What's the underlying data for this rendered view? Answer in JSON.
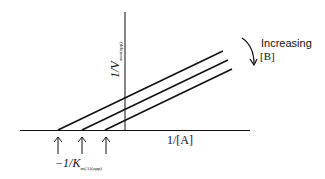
{
  "diagram": {
    "type": "Lineweaver-Burk double-reciprocal plot",
    "y_axis_label": "1/V",
    "y_axis_subscript": "max(app)",
    "x_axis_label": "1/[A]",
    "annotation_label": "Increasing",
    "annotation_label2": "[B]",
    "intercept_label": "−1/K",
    "intercept_subscript": "m(A)(app)",
    "series": [
      {
        "name": "line-1",
        "x_intercept_px": 58
      },
      {
        "name": "line-2",
        "x_intercept_px": 82
      },
      {
        "name": "line-3",
        "x_intercept_px": 105
      }
    ],
    "line_color": "#111111"
  }
}
